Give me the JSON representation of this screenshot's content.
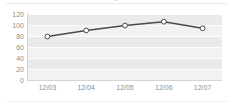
{
  "widget": {
    "title_clipped": "Report",
    "accent_color": "#4a4a4a",
    "marker_fill": "#ffffff",
    "plot_band_color": "#eaeaea",
    "plot_bg_color": "#f2f2f2",
    "gridline_color": "#fdfdfd",
    "axis_label_color": "#8d8d8d"
  },
  "chart_data": {
    "type": "line",
    "title": "",
    "xlabel": "",
    "ylabel": "",
    "categories": [
      "12/03",
      "12/04",
      "12/05",
      "12/06",
      "12/07"
    ],
    "values": [
      79,
      90,
      99,
      106,
      94
    ],
    "ylim": [
      0,
      120
    ],
    "yticks": [
      0,
      20,
      40,
      60,
      80,
      100,
      120
    ],
    "ytick_labels": [
      "0",
      "20",
      "40",
      "60",
      "80",
      "100",
      "120"
    ],
    "grid": true,
    "legend": "none",
    "markers": "circle"
  }
}
